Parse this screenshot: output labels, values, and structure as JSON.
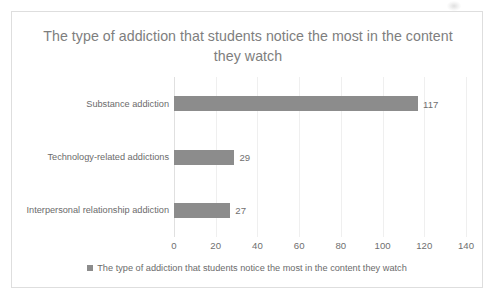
{
  "chart_data": {
    "type": "bar",
    "orientation": "horizontal",
    "title": "The type of addiction that students notice the most in the content they watch",
    "categories": [
      "Substance addiction",
      "Technology-related addictions",
      "Interpersonal relationship addiction"
    ],
    "values": [
      117,
      29,
      27
    ],
    "data_labels": [
      "117",
      "29",
      "27"
    ],
    "xlabel": "",
    "ylabel": "",
    "xlim": [
      0,
      140
    ],
    "xticks": [
      0,
      20,
      40,
      60,
      80,
      100,
      120,
      140
    ],
    "xtick_labels": [
      "0",
      "20",
      "40",
      "60",
      "80",
      "100",
      "120",
      "140"
    ],
    "grid": "vertical-only",
    "legend": {
      "position": "bottom",
      "entries": [
        {
          "label": "The type of addiction that students notice the most in the content they watch",
          "color": "#8c8c8c",
          "marker": "square"
        }
      ]
    },
    "colors": {
      "bar": "#8c8c8c",
      "title_text": "#7e7e7e",
      "tick_text": "#6f6f6f",
      "category_text": "#6b6b6b",
      "gridline": "#efefef",
      "axis_line": "#e0e0e0",
      "frame_border": "#dedede",
      "background": "#ffffff"
    }
  }
}
